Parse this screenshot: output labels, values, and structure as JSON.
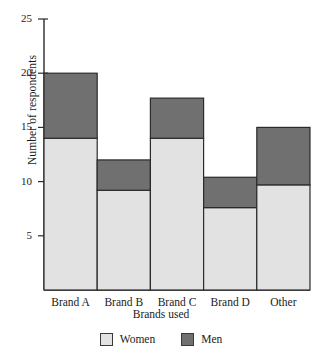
{
  "chart_data": {
    "type": "bar",
    "subtype": "stacked",
    "title": "",
    "xlabel": "Brands used",
    "ylabel": "Number of respondents",
    "categories": [
      "Brand A",
      "Brand B",
      "Brand C",
      "Brand D",
      "Other"
    ],
    "series": [
      {
        "name": "Women",
        "color": "#e2e2e2",
        "values": [
          14,
          9.2,
          14,
          7.6,
          9.7
        ]
      },
      {
        "name": "Men",
        "color": "#707070",
        "values": [
          6,
          2.8,
          3.7,
          2.8,
          5.3
        ]
      }
    ],
    "totals": [
      20,
      12,
      17.7,
      10.4,
      15
    ],
    "ylim": [
      0,
      25
    ],
    "yticks": [
      5,
      10,
      15,
      20,
      25
    ],
    "ytick_labels": [
      "5",
      "10",
      "15",
      "20",
      "25"
    ],
    "grid": false,
    "legend_position": "bottom",
    "legend": [
      {
        "label": "Women",
        "color": "#e2e2e2"
      },
      {
        "label": "Men",
        "color": "#707070"
      }
    ]
  },
  "axis": {
    "line_color": "#2b2b2b",
    "bar_edge_color": "#2b2b2b"
  }
}
